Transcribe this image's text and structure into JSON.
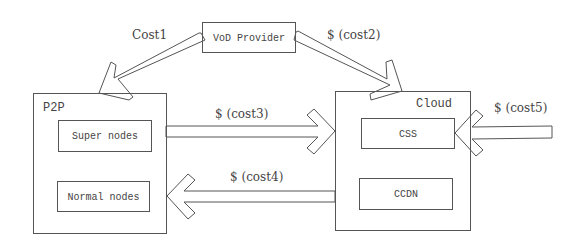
{
  "nodes": {
    "vod_provider": "VoD Provider",
    "p2p": "P2P",
    "super_nodes": "Super nodes",
    "normal_nodes": "Normal nodes",
    "cloud": "Cloud",
    "css": "CSS",
    "ccdn": "CCDN"
  },
  "edges": {
    "cost1": "Cost1",
    "cost2": "$ (cost2)",
    "cost3": "$ (cost3)",
    "cost4": "$ (cost4)",
    "cost5": "$ (cost5)"
  },
  "colors": {
    "stroke": "#555555",
    "text": "#444444",
    "background": "#ffffff"
  }
}
